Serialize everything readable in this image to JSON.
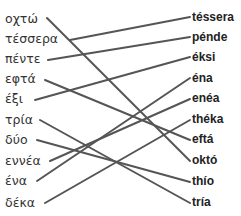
{
  "exercise": {
    "left_words": [
      "οχτώ",
      "τέσσερα",
      "πέντε",
      "εφτά",
      "έξι",
      "τρία",
      "δύο",
      "εννέα",
      "ένα",
      "δέκα"
    ],
    "right_words": [
      "téssera",
      "pénde",
      "éksi",
      "éna",
      "enéa",
      "théka",
      "eftá",
      "októ",
      "thío",
      "tría"
    ],
    "matches": [
      {
        "left": "οχτώ",
        "right": "októ"
      },
      {
        "left": "τέσσερα",
        "right": "téssera"
      },
      {
        "left": "πέντε",
        "right": "pénde"
      },
      {
        "left": "εφτά",
        "right": "eftá"
      },
      {
        "left": "έξι",
        "right": "éksi"
      },
      {
        "left": "τρία",
        "right": "tría"
      },
      {
        "left": "δύο",
        "right": "thío"
      },
      {
        "left": "εννέα",
        "right": "enéa"
      },
      {
        "left": "ένα",
        "right": "éna"
      },
      {
        "left": "δέκα",
        "right": "théka"
      }
    ],
    "line_color": "#555555"
  }
}
